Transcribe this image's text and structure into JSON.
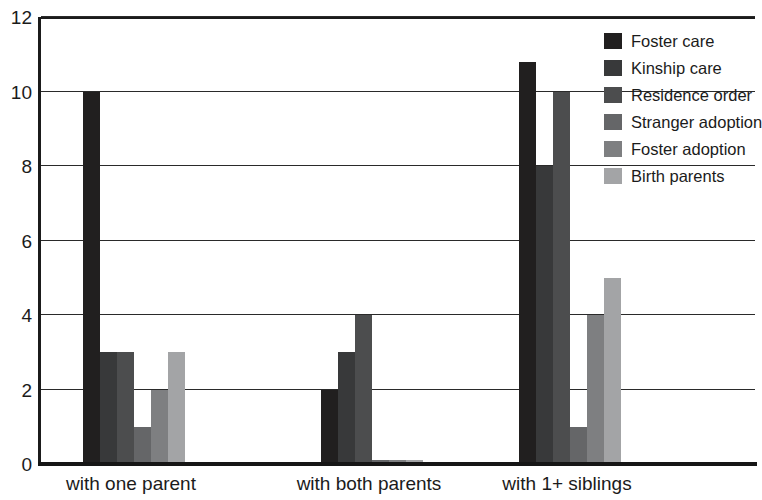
{
  "chart_data": {
    "type": "bar",
    "title": "",
    "subtitle": "",
    "xlabel": "",
    "ylabel": "",
    "ylim": [
      0,
      12
    ],
    "yticks": [
      0,
      2,
      4,
      6,
      8,
      10,
      12
    ],
    "grid": true,
    "legend_position": "top-right",
    "categories": [
      "with one parent",
      "with both parents",
      "with 1+ siblings"
    ],
    "series": [
      {
        "name": "Foster care",
        "color": "#211f1f",
        "values": [
          10,
          2,
          10.8
        ]
      },
      {
        "name": "Kinship care",
        "color": "#38393a",
        "values": [
          3,
          3,
          8
        ]
      },
      {
        "name": "Residence order",
        "color": "#4c4d4e",
        "values": [
          3,
          4,
          10
        ]
      },
      {
        "name": "Stranger adoption",
        "color": "#656668",
        "values": [
          1,
          0.12,
          1
        ]
      },
      {
        "name": "Foster adoption",
        "color": "#7e7f81",
        "values": [
          2,
          0.12,
          4
        ]
      },
      {
        "name": "Birth parents",
        "color": "#a3a4a6",
        "values": [
          3,
          0.12,
          5
        ]
      }
    ]
  },
  "axis": {
    "line_color": "#1b1b1b",
    "grid_color": "#2a2a2a"
  }
}
